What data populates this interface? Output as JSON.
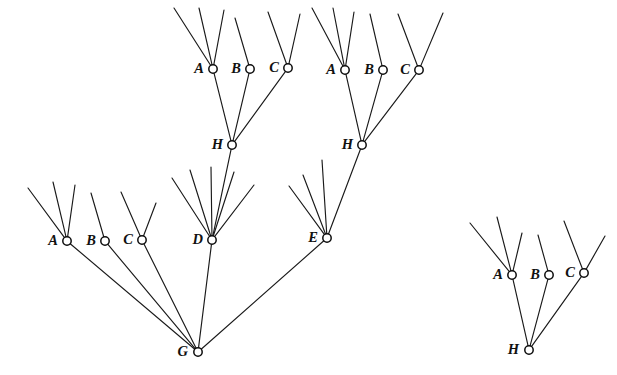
{
  "figure": {
    "width": 617,
    "height": 375,
    "background_color": "#ffffff",
    "line_color": "#1a1a1a",
    "node_fill_color": "#ffffff",
    "node_stroke_color": "#0d0d0d",
    "label_color": "#111111",
    "node_radius": 4.2
  },
  "nodes": [
    {
      "id": "n_A_top_left",
      "label": "A",
      "x": 213,
      "y": 69,
      "label_dx": -9,
      "label_dy": 1
    },
    {
      "id": "n_B_top_left",
      "label": "B",
      "x": 250,
      "y": 69,
      "label_dx": -9,
      "label_dy": 1
    },
    {
      "id": "n_C_top_left",
      "label": "C",
      "x": 288,
      "y": 68,
      "label_dx": -9,
      "label_dy": 1
    },
    {
      "id": "n_H_top_left",
      "label": "H",
      "x": 232,
      "y": 145,
      "label_dx": -9,
      "label_dy": 1
    },
    {
      "id": "n_A_top_right",
      "label": "A",
      "x": 345,
      "y": 70,
      "label_dx": -9,
      "label_dy": 1
    },
    {
      "id": "n_B_top_right",
      "label": "B",
      "x": 383,
      "y": 70,
      "label_dx": -9,
      "label_dy": 1
    },
    {
      "id": "n_C_top_right",
      "label": "C",
      "x": 419,
      "y": 70,
      "label_dx": -9,
      "label_dy": 1
    },
    {
      "id": "n_H_top_right",
      "label": "H",
      "x": 362,
      "y": 145,
      "label_dx": -9,
      "label_dy": 1
    },
    {
      "id": "n_A_left",
      "label": "A",
      "x": 67,
      "y": 241,
      "label_dx": -9,
      "label_dy": 1
    },
    {
      "id": "n_B_left",
      "label": "B",
      "x": 105,
      "y": 241,
      "label_dx": -9,
      "label_dy": 1
    },
    {
      "id": "n_C_left",
      "label": "C",
      "x": 142,
      "y": 240,
      "label_dx": -9,
      "label_dy": 1
    },
    {
      "id": "n_D",
      "label": "D",
      "x": 212,
      "y": 240,
      "label_dx": -9,
      "label_dy": 1
    },
    {
      "id": "n_E",
      "label": "E",
      "x": 327,
      "y": 238,
      "label_dx": -9,
      "label_dy": 1
    },
    {
      "id": "n_G",
      "label": "G",
      "x": 198,
      "y": 352,
      "label_dx": -10,
      "label_dy": 1
    },
    {
      "id": "n_A_iso",
      "label": "A",
      "x": 512,
      "y": 275,
      "label_dx": -9,
      "label_dy": 1
    },
    {
      "id": "n_B_iso",
      "label": "B",
      "x": 549,
      "y": 275,
      "label_dx": -9,
      "label_dy": 1
    },
    {
      "id": "n_C_iso",
      "label": "C",
      "x": 584,
      "y": 273,
      "label_dx": -9,
      "label_dy": 1
    },
    {
      "id": "n_H_iso",
      "label": "H",
      "x": 529,
      "y": 350,
      "label_dx": -10,
      "label_dy": 1
    }
  ],
  "edges": [
    {
      "id": "e_H_A_top_left",
      "from": "n_H_top_left",
      "to": "n_A_top_left"
    },
    {
      "id": "e_H_B_top_left",
      "from": "n_H_top_left",
      "to": "n_B_top_left"
    },
    {
      "id": "e_H_C_top_left",
      "from": "n_H_top_left",
      "to": "n_C_top_left"
    },
    {
      "id": "e_D_H_top_left",
      "from": "n_D",
      "to": "n_H_top_left"
    },
    {
      "id": "e_H_A_top_right",
      "from": "n_H_top_right",
      "to": "n_A_top_right"
    },
    {
      "id": "e_H_B_top_right",
      "from": "n_H_top_right",
      "to": "n_B_top_right"
    },
    {
      "id": "e_H_C_top_right",
      "from": "n_H_top_right",
      "to": "n_C_top_right"
    },
    {
      "id": "e_E_H_top_right",
      "from": "n_E",
      "to": "n_H_top_right"
    },
    {
      "id": "e_G_A_left",
      "from": "n_G",
      "to": "n_A_left"
    },
    {
      "id": "e_G_B_left",
      "from": "n_G",
      "to": "n_B_left"
    },
    {
      "id": "e_G_C_left",
      "from": "n_G",
      "to": "n_C_left"
    },
    {
      "id": "e_G_D",
      "from": "n_G",
      "to": "n_D"
    },
    {
      "id": "e_G_E",
      "from": "n_G",
      "to": "n_E"
    },
    {
      "id": "e_H_A_iso",
      "from": "n_H_iso",
      "to": "n_A_iso"
    },
    {
      "id": "e_H_B_iso",
      "from": "n_H_iso",
      "to": "n_B_iso"
    },
    {
      "id": "e_H_C_iso",
      "from": "n_H_iso",
      "to": "n_C_iso"
    }
  ],
  "rays": [
    {
      "id": "r_A_top_left_1",
      "node": "n_A_top_left",
      "x2": 174,
      "y2": 8
    },
    {
      "id": "r_A_top_left_2",
      "node": "n_A_top_left",
      "x2": 199,
      "y2": 8
    },
    {
      "id": "r_A_top_left_3",
      "node": "n_A_top_left",
      "x2": 224,
      "y2": 10
    },
    {
      "id": "r_B_top_left_1",
      "node": "n_B_top_left",
      "x2": 235,
      "y2": 18
    },
    {
      "id": "r_C_top_left_1",
      "node": "n_C_top_left",
      "x2": 268,
      "y2": 12
    },
    {
      "id": "r_C_top_left_2",
      "node": "n_C_top_left",
      "x2": 300,
      "y2": 14
    },
    {
      "id": "r_A_top_right_1",
      "node": "n_A_top_right",
      "x2": 312,
      "y2": 8
    },
    {
      "id": "r_A_top_right_2",
      "node": "n_A_top_right",
      "x2": 333,
      "y2": 8
    },
    {
      "id": "r_A_top_right_3",
      "node": "n_A_top_right",
      "x2": 354,
      "y2": 12
    },
    {
      "id": "r_B_top_right_1",
      "node": "n_B_top_right",
      "x2": 370,
      "y2": 14
    },
    {
      "id": "r_C_top_right_1",
      "node": "n_C_top_right",
      "x2": 398,
      "y2": 14
    },
    {
      "id": "r_C_top_right_2",
      "node": "n_C_top_right",
      "x2": 443,
      "y2": 13
    },
    {
      "id": "r_A_left_1",
      "node": "n_A_left",
      "x2": 28,
      "y2": 188
    },
    {
      "id": "r_A_left_2",
      "node": "n_A_left",
      "x2": 53,
      "y2": 182
    },
    {
      "id": "r_A_left_3",
      "node": "n_A_left",
      "x2": 75,
      "y2": 185
    },
    {
      "id": "r_B_left_1",
      "node": "n_B_left",
      "x2": 91,
      "y2": 193
    },
    {
      "id": "r_C_left_1",
      "node": "n_C_left",
      "x2": 121,
      "y2": 192
    },
    {
      "id": "r_C_left_2",
      "node": "n_C_left",
      "x2": 156,
      "y2": 203
    },
    {
      "id": "r_D_1",
      "node": "n_D",
      "x2": 172,
      "y2": 178
    },
    {
      "id": "r_D_2",
      "node": "n_D",
      "x2": 190,
      "y2": 170
    },
    {
      "id": "r_D_3",
      "node": "n_D",
      "x2": 211,
      "y2": 167
    },
    {
      "id": "r_D_4",
      "node": "n_D",
      "x2": 234,
      "y2": 172
    },
    {
      "id": "r_D_5",
      "node": "n_D",
      "x2": 254,
      "y2": 185
    },
    {
      "id": "r_E_1",
      "node": "n_E",
      "x2": 289,
      "y2": 186
    },
    {
      "id": "r_E_2",
      "node": "n_E",
      "x2": 303,
      "y2": 175
    },
    {
      "id": "r_E_3",
      "node": "n_E",
      "x2": 322,
      "y2": 160
    },
    {
      "id": "r_A_iso_1",
      "node": "n_A_iso",
      "x2": 470,
      "y2": 223
    },
    {
      "id": "r_A_iso_2",
      "node": "n_A_iso",
      "x2": 497,
      "y2": 217
    },
    {
      "id": "r_A_iso_3",
      "node": "n_A_iso",
      "x2": 522,
      "y2": 233
    },
    {
      "id": "r_B_iso_1",
      "node": "n_B_iso",
      "x2": 538,
      "y2": 235
    },
    {
      "id": "r_C_iso_1",
      "node": "n_C_iso",
      "x2": 564,
      "y2": 221
    },
    {
      "id": "r_C_iso_2",
      "node": "n_C_iso",
      "x2": 605,
      "y2": 236
    }
  ]
}
